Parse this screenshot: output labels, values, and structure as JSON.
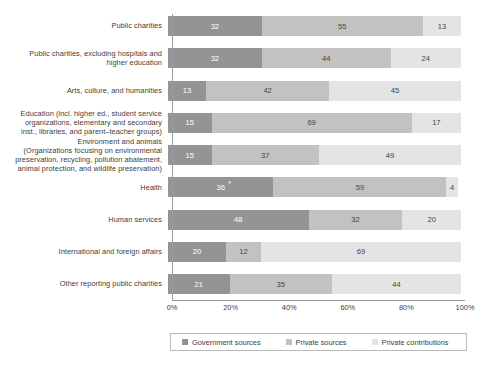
{
  "chart_data": {
    "type": "bar",
    "orientation": "horizontal",
    "stacked": true,
    "normalized_percent": true,
    "title": "",
    "subtitle": "",
    "xlabel": "",
    "ylabel": "",
    "xlim": [
      0,
      100
    ],
    "xticks": [
      "0%",
      "20%",
      "40%",
      "60%",
      "80%",
      "100%"
    ],
    "xtick_values": [
      0,
      20,
      40,
      60,
      80,
      100
    ],
    "grid": false,
    "legend_position": "bottom",
    "categories": [
      "Public charities",
      "Public charities, excluding hospitals and higher education",
      "Arts, culture, and humanities",
      "Education (incl. higher ed., student service organizations, elementary and secondary inst., libraries, and parent–teacher groups)",
      "Environment and animals (Organizations focusing on environmental preservation, recycling, pollution abatement, animal protection, and wildlife preservation)",
      "Health",
      "Human services",
      "International and foreign affairs",
      "Other reporting public charities"
    ],
    "category_lines": [
      [
        "Public charities"
      ],
      [
        "Public charities, excluding hospitals and",
        "higher education"
      ],
      [
        "Arts, culture, and humanities"
      ],
      [
        "Education (incl. higher ed., student service",
        "organizations, elementary and secondary",
        "inst., libraries, and parent–teacher groups)"
      ],
      [
        "Environment and animals",
        "(Organizations focusing on environmental",
        "preservation, recycling, pollution abatement,",
        "animal protection, and wildlife preservation)"
      ],
      [
        "Health"
      ],
      [
        "Human services"
      ],
      [
        "International and foreign affairs"
      ],
      [
        "Other reporting public charities"
      ]
    ],
    "series": [
      {
        "name": "Government sources",
        "color": "#949494",
        "values": [
          32,
          32,
          13,
          15,
          15,
          36,
          48,
          20,
          21
        ]
      },
      {
        "name": "Private sources",
        "color": "#c2c2c2",
        "values": [
          55,
          44,
          42,
          69,
          37,
          59,
          32,
          12,
          35
        ]
      },
      {
        "name": "Private contributions",
        "color": "#e4e4e4",
        "values": [
          13,
          24,
          45,
          17,
          49,
          4,
          20,
          69,
          44
        ]
      }
    ],
    "annotations": [
      {
        "category": "Health",
        "series": "Government sources",
        "marker": "*"
      }
    ]
  },
  "legend": {
    "items": [
      {
        "label": "Government sources",
        "color": "#949494"
      },
      {
        "label": "Private sources",
        "color": "#c2c2c2"
      },
      {
        "label": "Private contributions",
        "color": "#e4e4e4"
      }
    ]
  }
}
